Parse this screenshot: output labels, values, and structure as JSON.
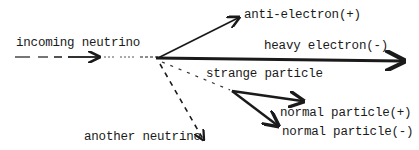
{
  "diagram": {
    "ink_color": "#1a1a1a",
    "background": "#ffffff",
    "labels": {
      "incoming": "incoming neutrino",
      "anti_electron": "anti-electron(+)",
      "heavy_electron": "heavy electron(-)",
      "strange_particle": "strange particle",
      "normal_plus": "normal particle(+)",
      "normal_minus": "normal particle(-)",
      "another_neutrino": "another neutrino"
    },
    "tracks": [
      {
        "name": "incoming neutrino",
        "style": "dashed",
        "from": [
          15,
          57
        ],
        "to": [
          158,
          57
        ]
      },
      {
        "name": "anti-electron(+)",
        "style": "solid",
        "from": [
          158,
          57
        ],
        "to": [
          237,
          18
        ]
      },
      {
        "name": "heavy electron(-)",
        "style": "solid-thick",
        "from": [
          158,
          57
        ],
        "to": [
          402,
          61
        ]
      },
      {
        "name": "strange particle",
        "style": "dashed",
        "from": [
          158,
          57
        ],
        "to": [
          232,
          91
        ]
      },
      {
        "name": "normal particle(+)",
        "style": "solid",
        "from": [
          232,
          91
        ],
        "to": [
          302,
          101
        ]
      },
      {
        "name": "normal particle(-)",
        "style": "solid",
        "from": [
          232,
          91
        ],
        "to": [
          277,
          125
        ]
      },
      {
        "name": "another neutrino",
        "style": "dashed",
        "from": [
          160,
          63
        ],
        "to": [
          203,
          139
        ]
      }
    ]
  }
}
